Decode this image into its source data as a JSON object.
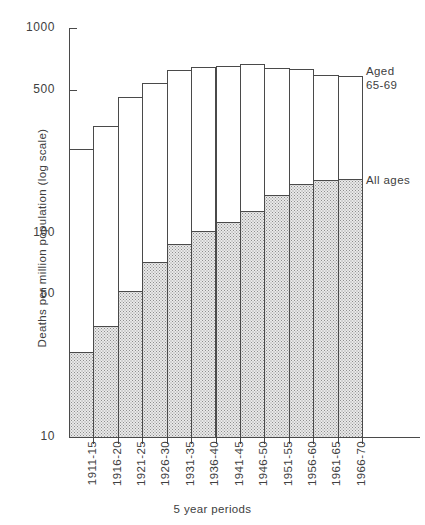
{
  "chart_data": {
    "type": "bar",
    "subtype": "stacked-overlay",
    "title": "",
    "xlabel": "5 year periods",
    "ylabel": "Deaths per million population (log scale)",
    "yscale": "log",
    "ylim": [
      10,
      1000
    ],
    "ytick_values": [
      1000,
      500,
      100,
      50,
      10
    ],
    "ytick_labels": [
      "1000",
      "500",
      "100",
      "50",
      "10"
    ],
    "grid": false,
    "legend_position": "right-inline-annotations",
    "categories": [
      "1911-15",
      "1916-20",
      "1921-25",
      "1926-30",
      "1931-35",
      "1936-40",
      "1941-45",
      "1946-50",
      "1951-55",
      "1956-60",
      "1961-65",
      "1966-70"
    ],
    "series": [
      {
        "name": "Aged 65-69",
        "label": "Aged\n65-69",
        "fill": "white",
        "values": [
          255,
          330,
          460,
          540,
          620,
          645,
          650,
          670,
          640,
          630,
          590,
          580
        ]
      },
      {
        "name": "All ages",
        "label": "All ages",
        "fill": "stippled",
        "values": [
          26,
          35,
          52,
          72,
          88,
          102,
          112,
          128,
          152,
          172,
          180,
          183
        ]
      }
    ],
    "annotations": [
      {
        "name": "aged-65-69",
        "text": "Aged\n65-69"
      },
      {
        "name": "all-ages",
        "text": "All ages"
      }
    ]
  },
  "colors": {
    "ink": "#404040",
    "axis": "#4a4a4a",
    "bar_fill": "#ffffff",
    "shaded_fill": "#e9e9e9",
    "stipple": "#8d8d8d",
    "background": "#ffffff"
  }
}
